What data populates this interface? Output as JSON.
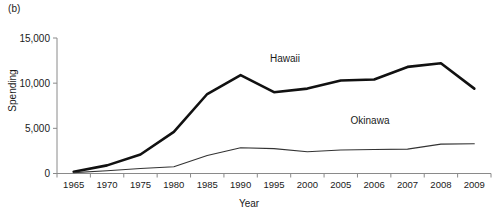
{
  "figure": {
    "panel_label": "(b)"
  },
  "chart_data": {
    "type": "line",
    "title": "",
    "xlabel": "Year",
    "ylabel": "Spending",
    "categories": [
      "1965",
      "1970",
      "1975",
      "1980",
      "1985",
      "1990",
      "1995",
      "2000",
      "2005",
      "2006",
      "2007",
      "2008",
      "2009"
    ],
    "yticks": [
      0,
      5000,
      10000,
      15000
    ],
    "ytick_labels": [
      "0",
      "5,000",
      "10,000",
      "15,000"
    ],
    "ylim": [
      0,
      15000
    ],
    "grid": false,
    "legend_position": "inline-annotations",
    "series": [
      {
        "name": "Hawaii",
        "label_x_category": "1995",
        "values": [
          200,
          900,
          2100,
          4600,
          8800,
          10900,
          9000,
          9400,
          10300,
          10400,
          11800,
          12200,
          9400
        ]
      },
      {
        "name": "Okinawa",
        "label_x_category": "2005",
        "values": [
          100,
          300,
          550,
          750,
          2000,
          2850,
          2750,
          2400,
          2600,
          2650,
          2700,
          3250,
          3300
        ]
      }
    ],
    "annotations": [
      {
        "text": "Hawaii",
        "x": 285,
        "y": 62
      },
      {
        "text": "Okinawa",
        "x": 370,
        "y": 124
      }
    ]
  }
}
